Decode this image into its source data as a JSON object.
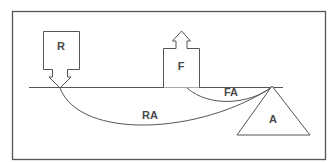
{
  "diagram": {
    "type": "lever-force-diagram",
    "labels": {
      "resistance": "R",
      "force": "F",
      "fulcrum": "A",
      "resistance_arm": "RA",
      "force_arm": "FA"
    },
    "elements": [
      {
        "id": "R",
        "shape": "box-with-down-arrow",
        "meaning": "resistance load"
      },
      {
        "id": "F",
        "shape": "box-with-up-arrow",
        "meaning": "applied force"
      },
      {
        "id": "A",
        "shape": "triangle",
        "meaning": "fulcrum / axis"
      },
      {
        "id": "RA",
        "shape": "arc",
        "from": "R",
        "to": "A"
      },
      {
        "id": "FA",
        "shape": "arc",
        "from": "F",
        "to": "A"
      }
    ],
    "colors": {
      "stroke": "#555555",
      "text": "#4a4a4a",
      "background": "#ffffff"
    }
  }
}
